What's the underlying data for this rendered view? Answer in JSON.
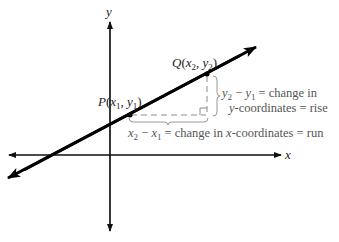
{
  "diagram": {
    "axes": {
      "x_label": "x",
      "y_label": "y"
    },
    "points": {
      "P": {
        "name": "P",
        "coords": "(x₁, y₁)",
        "name_italic": "P",
        "x_var": "x",
        "x_sub": "1",
        "y_var": "y",
        "y_sub": "1"
      },
      "Q": {
        "name": "Q",
        "coords": "(x₂, y₂)",
        "x_var": "x",
        "x_sub": "2",
        "y_var": "y",
        "y_sub": "2"
      }
    },
    "rise_annotation": {
      "line1_lhs_a": "y",
      "line1_sub_a": "2",
      "line1_minus": " − ",
      "line1_lhs_b": "y",
      "line1_sub_b": "1",
      "line1_rhs": " = change in",
      "line2_var": "y",
      "line2_rest": "-coordinates = rise"
    },
    "run_annotation": {
      "lhs_a": "x",
      "sub_a": "2",
      "minus": " − ",
      "lhs_b": "x",
      "sub_b": "1",
      "rhs_a": " = change in ",
      "var": "x",
      "rhs_b": "-coordinates = run"
    },
    "colors": {
      "line": "#000000",
      "axes": "#111111",
      "dashed": "#8a8a8a",
      "annotation_text": "#555555",
      "brace": "#9a9a9a"
    }
  }
}
